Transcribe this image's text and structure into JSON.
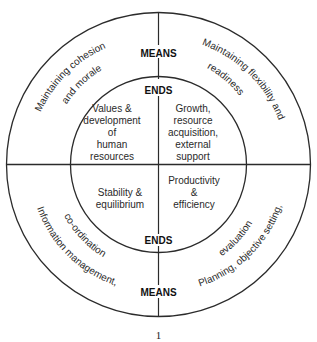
{
  "diagram": {
    "type": "concentric-quadrant-diagram",
    "outer_ring_label_top": "MEANS",
    "outer_ring_label_bottom": "MEANS",
    "inner_ring_label_top": "ENDS",
    "inner_ring_label_bottom": "ENDS",
    "quadrants": {
      "top_left": {
        "means": [
          "Maintaining cohesion",
          "and morale"
        ],
        "ends": [
          "Values &",
          "development",
          "of",
          "human",
          "resources"
        ]
      },
      "top_right": {
        "means": [
          "Maintaining flexibility and",
          "readiness"
        ],
        "ends": [
          "Growth,",
          "resource",
          "acquisition,",
          "external",
          "support"
        ]
      },
      "bottom_left": {
        "means": [
          "Information management,",
          "co-ordination"
        ],
        "ends": [
          "Stability &",
          "equilibrium"
        ]
      },
      "bottom_right": {
        "means": [
          "Planning, objective setting,",
          "evaluation"
        ],
        "ends": [
          "Productivity",
          "&",
          "efficiency"
        ]
      }
    },
    "page_number": "1",
    "colors": {
      "line": "#2b2b2b",
      "text": "#2a2a2a",
      "background": "#ffffff"
    }
  }
}
